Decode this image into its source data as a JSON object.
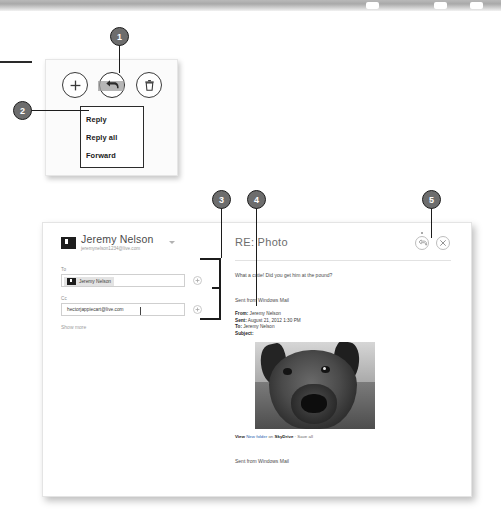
{
  "figure": {
    "appbar": {
      "buttons": [
        {
          "name": "new-mail",
          "icon": "plus-icon",
          "label": "New"
        },
        {
          "name": "respond",
          "icon": "reply-arrow-icon",
          "label": "Respond",
          "selected": true
        },
        {
          "name": "delete",
          "icon": "trash-icon",
          "label": "Delete"
        }
      ],
      "menu": {
        "items": [
          "Reply",
          "Reply all",
          "Forward"
        ]
      }
    },
    "callouts": [
      {
        "number": "1",
        "target": "respond-button"
      },
      {
        "number": "2",
        "target": "reply-menu"
      },
      {
        "number": "3",
        "target": "recipient-fields"
      },
      {
        "number": "4",
        "target": "message-body"
      },
      {
        "number": "5",
        "target": "send-button"
      }
    ]
  },
  "mail_window": {
    "account": {
      "name": "Jeremy Nelson",
      "email": "jeremynelson1234@live.com",
      "caret": "chevron-down-icon"
    },
    "fields": {
      "to_label": "To",
      "to_chip": "Jeremy Nelson",
      "cc_label": "Cc",
      "cc_value": "hectorjappiecart@live.com",
      "add_icon": "plus-circle-icon",
      "show_more": "Show more"
    },
    "compose": {
      "subject": "RE: Photo",
      "send_icon": "send-icon",
      "close_icon": "close-icon",
      "reply_text": "What a cutie! Did you get him at the pound?",
      "signature_top": "Sent from Windows Mail",
      "quoted_header": {
        "from_label": "From:",
        "from_value": "Jeremy Nelson",
        "sent_label": "Sent:",
        "sent_value": "August 21, 2012 1:30 PM",
        "to_label": "To:",
        "to_value": "Jeremy Nelson",
        "subject_label": "Subject:",
        "subject_value": ""
      },
      "attachment_line": {
        "view": "View",
        "folder": "New folder",
        "on": "on",
        "service": "SkyDrive",
        "separator": "·",
        "save_all": "Save all"
      },
      "photo_alt": "dog-photo",
      "signature_bottom": "Sent from Windows Mail"
    }
  }
}
